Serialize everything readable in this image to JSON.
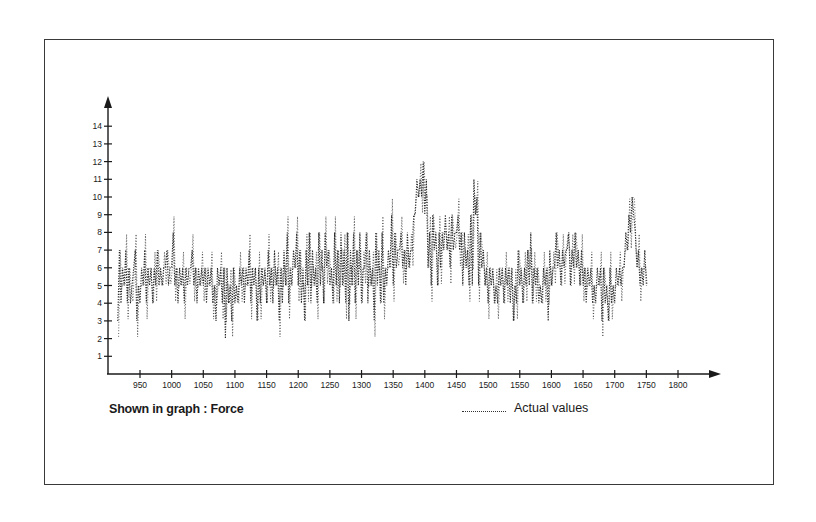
{
  "chart_data": {
    "type": "line",
    "title": "",
    "xlabel": "",
    "ylabel": "",
    "caption": "Shown in graph : Force",
    "legend": [
      {
        "label": "Actual values",
        "style": "dotted"
      }
    ],
    "legend_position": "bottom-right",
    "grid": false,
    "xlim": [
      900,
      1850
    ],
    "ylim": [
      0,
      14.8
    ],
    "x_ticks": [
      950,
      1000,
      1050,
      1100,
      1150,
      1200,
      1250,
      1300,
      1350,
      1400,
      1450,
      1500,
      1550,
      1600,
      1650,
      1700,
      1750,
      1800
    ],
    "y_ticks": [
      1,
      2,
      3,
      4,
      5,
      6,
      7,
      8,
      9,
      10,
      11,
      12,
      13,
      14
    ],
    "series": [
      {
        "name": "Actual values",
        "x_start": 915,
        "x_step": 2.5,
        "values": [
          3,
          7,
          4,
          6,
          5,
          7,
          4,
          6,
          4,
          5,
          6,
          7,
          3,
          5,
          4,
          6,
          5,
          7,
          4,
          6,
          5,
          6,
          4,
          6,
          5,
          7,
          5,
          6,
          5,
          6,
          6,
          7,
          5,
          6,
          6,
          8,
          5,
          6,
          4,
          6,
          5,
          6,
          4,
          6,
          5,
          6,
          6,
          7,
          5,
          6,
          4,
          6,
          5,
          6,
          5,
          6,
          4,
          6,
          5,
          6,
          4,
          5,
          3,
          6,
          5,
          6,
          4,
          6,
          2,
          6,
          4,
          5,
          3,
          6,
          4,
          5,
          4,
          6,
          5,
          6,
          4,
          6,
          5,
          7,
          4,
          6,
          5,
          6,
          3,
          6,
          4,
          6,
          5,
          6,
          4,
          7,
          5,
          6,
          4,
          7,
          5,
          6,
          3,
          6,
          4,
          7,
          5,
          8,
          4,
          6,
          5,
          7,
          6,
          8,
          5,
          7,
          4,
          6,
          3,
          7,
          5,
          8,
          4,
          7,
          5,
          6,
          4,
          8,
          5,
          7,
          4,
          8,
          6,
          7,
          5,
          6,
          4,
          8,
          5,
          7,
          4,
          8,
          5,
          7,
          4,
          8,
          3,
          7,
          5,
          8,
          4,
          7,
          5,
          8,
          4,
          6,
          6,
          8,
          4,
          7,
          5,
          6,
          3,
          8,
          5,
          7,
          4,
          8,
          4,
          6,
          5,
          7,
          6,
          9,
          5,
          8,
          6,
          7,
          7,
          8,
          6,
          7,
          5,
          8,
          6,
          7,
          7,
          9,
          9,
          11,
          10,
          11,
          10,
          12,
          9,
          11,
          6,
          8,
          5,
          9,
          7,
          8,
          5,
          8,
          6,
          8,
          7,
          9,
          7,
          8,
          6,
          9,
          7,
          8,
          8,
          9,
          7,
          8,
          5,
          8,
          6,
          7,
          5,
          9,
          5,
          11,
          9,
          10,
          5,
          8,
          6,
          7,
          5,
          6,
          4,
          6,
          5,
          6,
          4,
          5,
          4,
          6,
          5,
          6,
          4,
          6,
          5,
          6,
          4,
          6,
          3,
          5,
          4,
          7,
          5,
          6,
          4,
          6,
          5,
          7,
          5,
          8,
          4,
          6,
          5,
          6,
          4,
          5,
          4,
          6,
          5,
          6,
          3,
          7,
          5,
          6,
          6,
          8,
          6,
          7,
          5,
          7,
          6,
          7,
          7,
          8,
          5,
          7,
          6,
          8,
          6,
          7,
          5,
          7,
          5,
          6,
          4,
          6,
          5,
          6,
          4,
          5,
          4,
          6,
          5,
          6,
          3,
          6,
          4,
          5,
          3,
          6,
          4,
          5,
          4,
          6,
          5,
          6,
          5,
          6,
          6,
          8,
          7,
          9,
          8,
          10,
          9,
          8,
          6,
          7,
          5,
          6,
          5,
          7,
          5
        ]
      }
    ]
  },
  "axes": {
    "x_tick_labels": [
      "950",
      "1000",
      "1050",
      "1100",
      "1150",
      "1200",
      "1250",
      "1300",
      "1350",
      "1400",
      "1450",
      "1500",
      "1550",
      "1600",
      "1650",
      "1700",
      "1750",
      "1800"
    ],
    "y_tick_labels": [
      "1",
      "2",
      "3",
      "4",
      "5",
      "6",
      "7",
      "8",
      "9",
      "10",
      "11",
      "12",
      "13",
      "14"
    ]
  },
  "caption": {
    "text": "Shown in graph : Force"
  },
  "legend": {
    "label": "Actual values"
  },
  "colors": {
    "ink": "#1a1a1a",
    "frame": "#3a3a3a",
    "background": "#ffffff"
  }
}
